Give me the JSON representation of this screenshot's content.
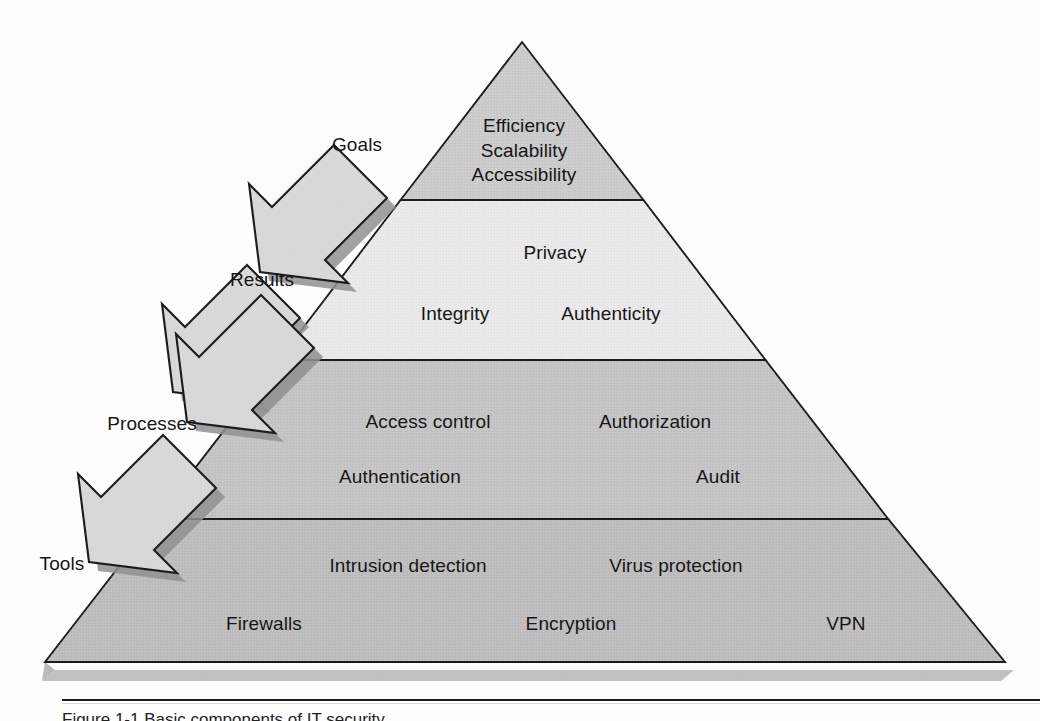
{
  "figure": {
    "type": "layered-pyramid-diagram",
    "background_color": "#ffffff",
    "outline_color": "#1c1c1c"
  },
  "pyramid": {
    "apex": {
      "x": 522,
      "y": 42
    },
    "base_left": {
      "x": 45,
      "y": 662
    },
    "base_right": {
      "x": 1005,
      "y": 662
    },
    "shadow_color": "#a8a8a8",
    "tiers": [
      {
        "name": "goals",
        "level": 1,
        "position": "apex",
        "fill": "#c9c9c9",
        "top_y": 42,
        "bottom_y": 200,
        "items": [
          "Efficiency",
          "Scalability",
          "Accessibility"
        ]
      },
      {
        "name": "results",
        "level": 2,
        "fill": "#e8e8e8",
        "top_y": 200,
        "bottom_y": 360,
        "items": [
          "Privacy",
          "Integrity",
          "Authenticity"
        ]
      },
      {
        "name": "processes",
        "level": 3,
        "fill": "#c2c2c2",
        "top_y": 360,
        "bottom_y": 519,
        "items": [
          "Access control",
          "Authorization",
          "Authentication",
          "Audit"
        ]
      },
      {
        "name": "tools",
        "level": 4,
        "position": "base",
        "fill": "#bdbdbd",
        "top_y": 519,
        "bottom_y": 662,
        "items": [
          "Intrusion detection",
          "Virus protection",
          "Firewalls",
          "Encryption",
          "VPN"
        ]
      }
    ]
  },
  "tier_text": {
    "goals": [
      {
        "text": "Efficiency",
        "x": 524,
        "y": 127
      },
      {
        "text": "Scalability",
        "x": 524,
        "y": 151
      },
      {
        "text": "Accessibility",
        "x": 524,
        "y": 176
      }
    ],
    "results": [
      {
        "text": "Privacy",
        "x": 555,
        "y": 253
      },
      {
        "text": "Integrity",
        "x": 455,
        "y": 314
      },
      {
        "text": "Authenticity",
        "x": 611,
        "y": 314
      }
    ],
    "processes": [
      {
        "text": "Access control",
        "x": 428,
        "y": 422
      },
      {
        "text": "Authorization",
        "x": 655,
        "y": 422
      },
      {
        "text": "Authentication",
        "x": 400,
        "y": 477
      },
      {
        "text": "Audit",
        "x": 718,
        "y": 477
      }
    ],
    "tools": [
      {
        "text": "Intrusion detection",
        "x": 408,
        "y": 566
      },
      {
        "text": "Virus protection",
        "x": 676,
        "y": 566
      },
      {
        "text": "Firewalls",
        "x": 264,
        "y": 624
      },
      {
        "text": "Encryption",
        "x": 571,
        "y": 624
      },
      {
        "text": "VPN",
        "x": 846,
        "y": 624
      }
    ]
  },
  "arrows": {
    "fill": "#d6d6d6",
    "stroke": "#1c1c1c",
    "shadow": "#909090",
    "direction": "down-left",
    "items": [
      {
        "label": "Goals",
        "label_x": 357,
        "label_y": 145,
        "cx": 291,
        "cy": 210
      },
      {
        "label": "Results",
        "label_x": 262,
        "label_y": 280,
        "cx": 204,
        "cy": 330
      },
      {
        "label": "Processes",
        "label_x": 152,
        "label_y": 424,
        "cx": 218,
        "cy": 360
      },
      {
        "label": "Tools",
        "label_x": 62,
        "label_y": 564,
        "cx": 120,
        "cy": 500
      }
    ]
  },
  "caption": {
    "rule_visible": true,
    "text_clipped": true,
    "text": "Figure 1-1   Basic components of IT security"
  }
}
